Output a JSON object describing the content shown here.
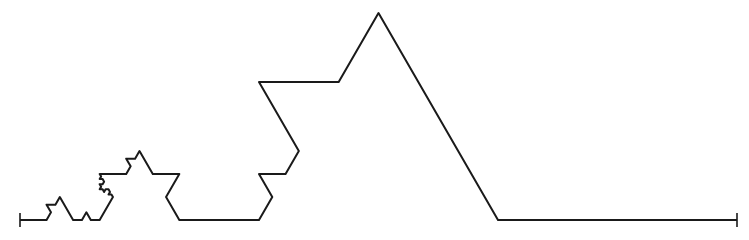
{
  "diagram": {
    "type": "koch-curve-mixed-depth",
    "stroke_color": "#1a1a1a",
    "background": "#ffffff",
    "baseline_y": 220,
    "start_x": 20,
    "end_x": 737,
    "end_tick_height": 14,
    "depth_program": [
      [
        3,
        [
          2,
          [
            0
          ],
          [
            1
          ],
          [
            0
          ],
          [
            1
          ]
        ],
        [
          3,
          [
            0
          ],
          [
            2
          ],
          [
            0
          ],
          [
            1
          ]
        ],
        [
          1
        ]
      ],
      [
        2,
        [
          1
        ],
        [
          0
        ],
        [
          0
        ],
        [
          0
        ]
      ],
      [
        0
      ],
      [
        0
      ]
    ]
  }
}
